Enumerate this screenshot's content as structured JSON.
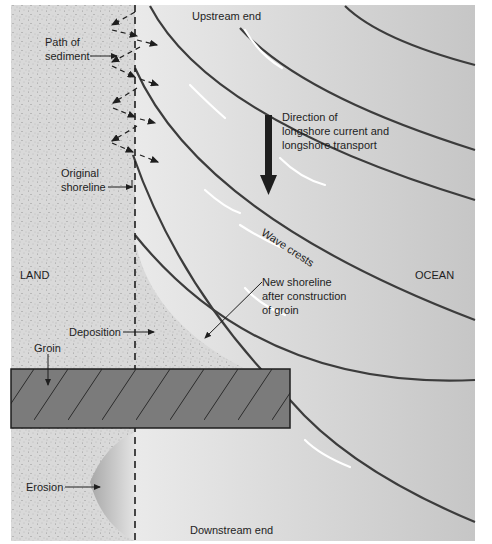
{
  "diagram": {
    "title_top": "Upstream end",
    "title_bottom": "Downstream end",
    "regions": {
      "land": "LAND",
      "ocean": "OCEAN"
    },
    "labels": {
      "path_of_sediment_1": "Path of",
      "path_of_sediment_2": "sediment",
      "original_shoreline_1": "Original",
      "original_shoreline_2": "shoreline",
      "direction_1": "Direction of",
      "direction_2": "longshore current and",
      "direction_3": "longshore transport",
      "wave_crests": "Wave crests",
      "new_shoreline_1": "New shoreline",
      "new_shoreline_2": "after construction",
      "new_shoreline_3": "of groin",
      "deposition": "Deposition",
      "groin": "Groin",
      "erosion": "Erosion"
    },
    "colors": {
      "land": "#d8d8d8",
      "ocean_light": "#f2f2f2",
      "ocean_dark": "#c9c9c9",
      "groin": "#7a7a7a",
      "wave_line": "#3c3c3c",
      "erosion": "#b0b0b0"
    }
  }
}
